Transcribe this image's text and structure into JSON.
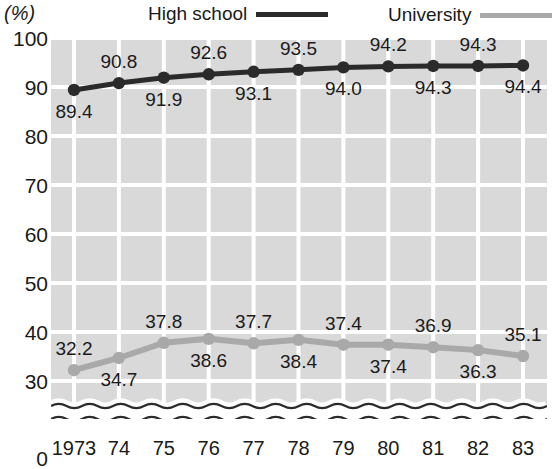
{
  "unit": {
    "label": "(%)"
  },
  "legend": {
    "entries": [
      {
        "label": "High  school",
        "color": "#2b2b2b",
        "key": "high_school"
      },
      {
        "label": "University",
        "color": "#a9a9a9",
        "key": "university"
      }
    ]
  },
  "axes": {
    "y_ticks": [
      "100",
      "90",
      "80",
      "70",
      "60",
      "50",
      "40",
      "30",
      "0"
    ],
    "x_ticks": [
      "1973",
      "74",
      "75",
      "76",
      "77",
      "78",
      "79",
      "80",
      "81",
      "82",
      "83"
    ]
  },
  "chart_data": {
    "type": "line",
    "title": "",
    "subtitle": "",
    "xlabel": "",
    "ylabel": "(%)",
    "grid": true,
    "legend_position": "top",
    "axis_break": true,
    "axis_break_note": "wavy break between 30 and 0",
    "ylim": [
      30,
      100
    ],
    "ytick_values": [
      100,
      90,
      80,
      70,
      60,
      50,
      40,
      30,
      0
    ],
    "categories": [
      "1973",
      "74",
      "75",
      "76",
      "77",
      "78",
      "79",
      "80",
      "81",
      "82",
      "83"
    ],
    "x": [
      1973,
      1974,
      1975,
      1976,
      1977,
      1978,
      1979,
      1980,
      1981,
      1982,
      1983
    ],
    "series": [
      {
        "name": "High  school",
        "color": "#2b2b2b",
        "values": [
          89.4,
          90.8,
          91.9,
          92.6,
          93.1,
          93.5,
          94.0,
          94.2,
          94.3,
          94.3,
          94.4
        ],
        "labels": [
          "89.4",
          "90.8",
          "91.9",
          "92.6",
          "93.1",
          "93.5",
          "94.0",
          "94.2",
          "94.3",
          "94.3",
          "94.4"
        ],
        "label_positions": [
          "below",
          "above",
          "below",
          "above",
          "below",
          "above",
          "below",
          "above",
          "below",
          "above",
          "below"
        ]
      },
      {
        "name": "University",
        "color": "#a9a9a9",
        "values": [
          32.2,
          34.7,
          37.8,
          38.6,
          37.7,
          38.4,
          37.4,
          37.4,
          36.9,
          36.3,
          35.1
        ],
        "labels": [
          "32.2",
          "34.7",
          "37.8",
          "38.6",
          "37.7",
          "38.4",
          "37.4",
          "37.4",
          "36.9",
          "36.3",
          "35.1"
        ],
        "label_positions": [
          "above",
          "below",
          "above",
          "below",
          "above",
          "below",
          "above",
          "below",
          "above",
          "below",
          "above"
        ]
      }
    ]
  }
}
